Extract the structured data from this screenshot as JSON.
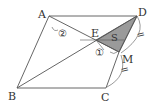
{
  "diagram": {
    "type": "geometry-figure",
    "shape": "quadrilateral ABCD with point M on CD",
    "points": {
      "A": {
        "label": "A",
        "x": 49,
        "y": 16
      },
      "B": {
        "label": "B",
        "x": 17,
        "y": 88
      },
      "C": {
        "label": "C",
        "x": 106,
        "y": 88
      },
      "D": {
        "label": "D",
        "x": 137,
        "y": 16
      },
      "E": {
        "label": "E",
        "x": 96,
        "y": 40
      },
      "M": {
        "label": "M",
        "x": 119,
        "y": 52
      }
    },
    "shaded_region": {
      "label": "S",
      "vertices": [
        "E",
        "D",
        "M"
      ],
      "color": "#9a9a9a"
    },
    "angle_marks": [
      {
        "label": "②",
        "at": "A"
      },
      {
        "label": "①",
        "at": "M"
      }
    ],
    "equal_marks": [
      {
        "segment": "DM",
        "mark": "="
      },
      {
        "segment": "MC",
        "mark": "="
      }
    ],
    "colors": {
      "stroke": "#555555",
      "fill": "#9a9a9a",
      "text": "#333333"
    }
  }
}
